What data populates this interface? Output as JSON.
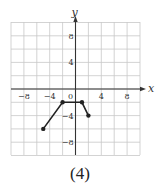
{
  "chart_data": {
    "type": "line",
    "title": "",
    "xlabel": "x",
    "ylabel": "y",
    "xlim": [
      -10,
      10
    ],
    "ylim": [
      -10,
      10
    ],
    "grid": true,
    "grid_step": 2,
    "x_ticks": [
      -8,
      -4,
      0,
      4,
      8
    ],
    "y_ticks": [
      8,
      4,
      -4,
      -8
    ],
    "origin_label": "0",
    "series": [
      {
        "name": "piecewise",
        "points": [
          [
            -5,
            -6
          ],
          [
            -2,
            -2
          ],
          [
            1,
            -2
          ],
          [
            2,
            -4
          ]
        ],
        "closed_endpoints": true
      }
    ],
    "caption": "(4)"
  },
  "labels": {
    "x_axis": "x",
    "y_axis": "y",
    "caption": "(4)"
  },
  "colors": {
    "grid": "#c8c8c8",
    "axis": "#333333",
    "line": "#222222"
  }
}
